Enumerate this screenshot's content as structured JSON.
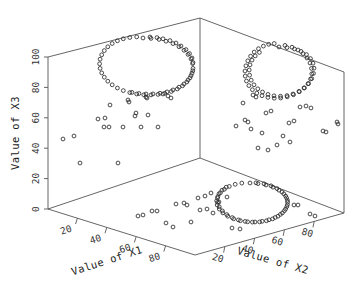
{
  "figure": {
    "type": "3d-scatter-plot",
    "background_color": "#ffffff",
    "marker_color": "#2a2a2a",
    "frame_color": "#555555",
    "marker_shape": "open-circle"
  },
  "axes": {
    "x1": {
      "title": "Value of X1",
      "ticks": [
        "20",
        "40",
        "60",
        "80"
      ],
      "range": [
        0,
        100
      ]
    },
    "x2": {
      "title": "Value of X2",
      "ticks": [
        "20",
        "40",
        "60",
        "80"
      ],
      "range": [
        0,
        100
      ]
    },
    "x3": {
      "title": "Value of X3",
      "ticks": [
        "0",
        "20",
        "40",
        "60",
        "80",
        "100"
      ],
      "range": [
        0,
        100
      ]
    }
  },
  "chart_data": {
    "type": "scatter",
    "title": "",
    "xlabel": "Value of X1",
    "ylabel": "Value of X2",
    "zlabel": "Value of X3",
    "xlim": [
      0,
      100
    ],
    "ylim": [
      0,
      100
    ],
    "zlim": [
      0,
      100
    ],
    "grid": false,
    "legend": null,
    "projection": "3d-box-three-panels",
    "panels": [
      {
        "name": "back-left-panel",
        "plane": "X1 by X3",
        "cluster": {
          "shape": "ring",
          "center_screen": [
            143,
            77
          ],
          "radius_screen": [
            50,
            39
          ],
          "n_points": 62
        },
        "noise_points": 22
      },
      {
        "name": "back-right-panel",
        "plane": "X2 by X3",
        "cluster": {
          "shape": "ellipse-ring-tilted",
          "center_screen": [
            283,
            92
          ],
          "radius_screen": [
            27,
            47
          ],
          "rotation_deg": -23,
          "n_points": 60
        },
        "noise_points": 24
      },
      {
        "name": "floor-panel",
        "plane": "X1 by X2",
        "cluster": {
          "shape": "ellipse-ring",
          "center_screen": [
            250,
            207
          ],
          "radius_screen": [
            36,
            24
          ],
          "rotation_deg": -8,
          "n_points": 55
        },
        "noise_points": 24
      }
    ],
    "series": [
      {
        "name": "ring-cluster-x1x3",
        "points_screen": [
          [
            143,
            38
          ],
          [
            151,
            38.4
          ],
          [
            159,
            39.4
          ],
          [
            166,
            41.2
          ],
          [
            173,
            43.6
          ],
          [
            179,
            46.7
          ],
          [
            184,
            50.3
          ],
          [
            188,
            54.4
          ],
          [
            191,
            58.9
          ],
          [
            192.6,
            63.6
          ],
          [
            193,
            68.4
          ],
          [
            192,
            73.2
          ],
          [
            190,
            77.8
          ],
          [
            186.8,
            82
          ],
          [
            182.5,
            85.8
          ],
          [
            177.3,
            89
          ],
          [
            171.3,
            91.5
          ],
          [
            164.8,
            93.3
          ],
          [
            158,
            94.4
          ],
          [
            151,
            94.9
          ],
          [
            143.8,
            94.8
          ],
          [
            136.7,
            94
          ],
          [
            129.8,
            92.6
          ],
          [
            123.3,
            90.6
          ],
          [
            117.4,
            88
          ],
          [
            112.2,
            84.8
          ],
          [
            107.8,
            81.2
          ],
          [
            104.3,
            77.2
          ],
          [
            101.7,
            72.9
          ],
          [
            100.1,
            68.4
          ],
          [
            99.6,
            63.8
          ],
          [
            100.1,
            59.2
          ],
          [
            101.7,
            54.8
          ],
          [
            104.3,
            50.6
          ],
          [
            107.8,
            46.8
          ],
          [
            112.2,
            43.5
          ],
          [
            117.4,
            40.8
          ],
          [
            123.3,
            38.8
          ],
          [
            129.8,
            37.5
          ],
          [
            136.7,
            36.9
          ],
          [
            150,
            37
          ],
          [
            157,
            37.6
          ],
          [
            163,
            38.8
          ],
          [
            170,
            40.6
          ],
          [
            176,
            43
          ],
          [
            181,
            46
          ],
          [
            186,
            49.6
          ],
          [
            189.5,
            53.6
          ],
          [
            192,
            58
          ],
          [
            193,
            62.5
          ],
          [
            192.8,
            70.8
          ],
          [
            191,
            75.6
          ],
          [
            188,
            80
          ],
          [
            184,
            83.9
          ],
          [
            179,
            87.2
          ],
          [
            173,
            89.9
          ],
          [
            167,
            91.9
          ],
          [
            160,
            93.2
          ],
          [
            153,
            93.9
          ],
          [
            146,
            94
          ],
          [
            139,
            93.5
          ],
          [
            132,
            92.4
          ]
        ]
      },
      {
        "name": "noise-x1x3",
        "points_screen": [
          [
            74,
            136
          ],
          [
            104,
            127
          ],
          [
            109,
            127
          ],
          [
            123,
            127
          ],
          [
            141,
            127
          ],
          [
            158,
            127
          ],
          [
            110,
            105
          ],
          [
            128,
            100
          ],
          [
            129,
            102
          ],
          [
            98,
            119
          ],
          [
            105,
            118
          ],
          [
            135,
            116
          ],
          [
            136,
            113
          ],
          [
            148,
            115
          ],
          [
            63,
            139
          ],
          [
            80,
            163
          ],
          [
            118,
            163
          ],
          [
            146,
            97
          ],
          [
            147,
            98
          ],
          [
            163,
            94
          ],
          [
            168,
            96
          ],
          [
            171,
            98
          ]
        ]
      },
      {
        "name": "ring-cluster-x2x3",
        "points_screen": [
          [
            279,
            47
          ],
          [
            287,
            47.6
          ],
          [
            294.5,
            49
          ],
          [
            301,
            51.4
          ],
          [
            306.5,
            54.6
          ],
          [
            310.5,
            58.6
          ],
          [
            313,
            63.2
          ],
          [
            314,
            68.2
          ],
          [
            313.5,
            73.4
          ],
          [
            311.7,
            78.6
          ],
          [
            308.6,
            83.5
          ],
          [
            304.4,
            87.9
          ],
          [
            299.3,
            91.7
          ],
          [
            293.5,
            94.7
          ],
          [
            287.2,
            96.8
          ],
          [
            280.7,
            98
          ],
          [
            274.2,
            98.2
          ],
          [
            267.9,
            97.4
          ],
          [
            262,
            95.7
          ],
          [
            256.8,
            93.1
          ],
          [
            252.4,
            89.7
          ],
          [
            248.9,
            85.6
          ],
          [
            246.5,
            81
          ],
          [
            245.2,
            76.1
          ],
          [
            245,
            71
          ],
          [
            245.9,
            65.8
          ],
          [
            247.8,
            60.8
          ],
          [
            250.6,
            56.2
          ],
          [
            254.2,
            52.1
          ],
          [
            258.5,
            48.7
          ],
          [
            263.4,
            46.1
          ],
          [
            268.7,
            44.3
          ],
          [
            274.2,
            43.5
          ],
          [
            285,
            45.4
          ],
          [
            292,
            47.2
          ],
          [
            298,
            50
          ],
          [
            303,
            53.6
          ],
          [
            307,
            58
          ],
          [
            310,
            63
          ],
          [
            311.5,
            68.4
          ],
          [
            311.8,
            73.8
          ],
          [
            310.6,
            79
          ],
          [
            308,
            83.8
          ],
          [
            304,
            88
          ],
          [
            299,
            91.4
          ],
          [
            293,
            94
          ],
          [
            287,
            95.6
          ],
          [
            280.5,
            96.2
          ],
          [
            274,
            95.8
          ],
          [
            268,
            94.4
          ],
          [
            262.5,
            92
          ],
          [
            257.8,
            88.8
          ],
          [
            254,
            84.8
          ],
          [
            251.2,
            80.2
          ],
          [
            249.6,
            75.2
          ],
          [
            249.2,
            70
          ],
          [
            250,
            64.9
          ],
          [
            252,
            60.1
          ],
          [
            255.2,
            55.9
          ],
          [
            259.4,
            52.4
          ]
        ]
      },
      {
        "name": "noise-x2x3",
        "points_screen": [
          [
            253,
            95
          ],
          [
            256,
            97
          ],
          [
            245,
            120
          ],
          [
            248,
            122
          ],
          [
            236,
            126
          ],
          [
            251,
            129
          ],
          [
            262,
            133
          ],
          [
            266,
            113
          ],
          [
            271,
            111
          ],
          [
            289,
            123
          ],
          [
            294,
            121
          ],
          [
            283,
            136
          ],
          [
            290,
            142
          ],
          [
            277,
            145
          ],
          [
            268,
            150
          ],
          [
            258,
            148
          ],
          [
            337,
            122
          ],
          [
            338,
            124
          ],
          [
            323,
            131
          ],
          [
            326,
            132
          ],
          [
            243,
            103
          ],
          [
            300,
            107
          ],
          [
            306,
            106
          ],
          [
            311,
            108
          ]
        ]
      },
      {
        "name": "ring-cluster-x1x2",
        "points_screen": [
          [
            250,
            183
          ],
          [
            258,
            183.6
          ],
          [
            266,
            185
          ],
          [
            273,
            187.2
          ],
          [
            279,
            190.2
          ],
          [
            283.8,
            193.8
          ],
          [
            286.6,
            197.9
          ],
          [
            287.6,
            202.2
          ],
          [
            286.8,
            206.6
          ],
          [
            284.4,
            210.7
          ],
          [
            280.4,
            214.4
          ],
          [
            275.2,
            217.5
          ],
          [
            269,
            219.8
          ],
          [
            262.2,
            221.3
          ],
          [
            255,
            222
          ],
          [
            247.6,
            221.8
          ],
          [
            240.4,
            220.7
          ],
          [
            233.7,
            218.8
          ],
          [
            227.8,
            216.2
          ],
          [
            222.9,
            212.9
          ],
          [
            219.3,
            209.1
          ],
          [
            217.2,
            205
          ],
          [
            216.7,
            200.8
          ],
          [
            217.8,
            196.6
          ],
          [
            220.4,
            192.7
          ],
          [
            224.3,
            189.3
          ],
          [
            229.3,
            186.4
          ],
          [
            235.2,
            184.3
          ],
          [
            241.8,
            183.1
          ],
          [
            256,
            182.8
          ],
          [
            264,
            183.8
          ],
          [
            271,
            185.8
          ],
          [
            277,
            188.6
          ],
          [
            282,
            192
          ],
          [
            285.6,
            196
          ],
          [
            287.4,
            200.3
          ],
          [
            287.4,
            204.7
          ],
          [
            285.6,
            209
          ],
          [
            282.4,
            212.9
          ],
          [
            278,
            216.2
          ],
          [
            272.6,
            218.9
          ],
          [
            266.4,
            220.8
          ],
          [
            259.6,
            221.9
          ],
          [
            252.4,
            222.1
          ],
          [
            245.2,
            221.4
          ],
          [
            238.4,
            219.9
          ],
          [
            232.2,
            217.6
          ],
          [
            226.8,
            214.6
          ],
          [
            222.4,
            210.9
          ],
          [
            219.3,
            206.8
          ],
          [
            217.6,
            202.4
          ],
          [
            217.5,
            198
          ],
          [
            219,
            193.8
          ],
          [
            222,
            190.2
          ],
          [
            226.2,
            187.2
          ]
        ]
      },
      {
        "name": "noise-x1x2",
        "points_screen": [
          [
            138,
            216
          ],
          [
            143,
            215
          ],
          [
            152,
            211
          ],
          [
            157,
            211
          ],
          [
            176,
            204
          ],
          [
            184,
            203
          ],
          [
            187,
            205
          ],
          [
            198,
            198
          ],
          [
            205,
            196
          ],
          [
            211,
            193
          ],
          [
            200,
            210
          ],
          [
            207,
            209
          ],
          [
            213,
            213
          ],
          [
            219,
            202
          ],
          [
            227,
            197
          ],
          [
            166,
            223
          ],
          [
            173,
            227
          ],
          [
            191,
            222
          ],
          [
            232,
            228
          ],
          [
            240,
            229
          ],
          [
            294,
            205
          ],
          [
            298,
            205
          ],
          [
            310,
            214
          ],
          [
            315,
            216
          ]
        ]
      }
    ]
  },
  "frame": {
    "origin_corner": [
      48,
      209
    ],
    "top_left_corner": [
      48,
      57
    ],
    "top_back_corner": [
      200,
      18
    ],
    "back_inner_corner": [
      200,
      158
    ],
    "top_right_corner": [
      344,
      72
    ],
    "right_bottom_corner": [
      344,
      213
    ],
    "front_bottom_corner": [
      195,
      255
    ]
  }
}
